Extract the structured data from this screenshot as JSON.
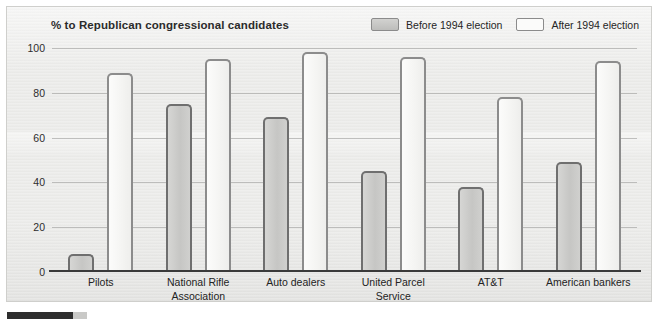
{
  "chart_data": {
    "type": "bar",
    "title": "% to Republican congressional candidates",
    "xlabel": "",
    "ylabel": "",
    "ylim": [
      0,
      100
    ],
    "yticks": [
      100,
      80,
      60,
      40,
      20,
      0
    ],
    "grid": true,
    "legend_position": "top-right",
    "categories": [
      "Pilots",
      "National Rifle Association",
      "Auto dealers",
      "United Parcel Service",
      "AT&T",
      "American bankers"
    ],
    "category_lines": [
      [
        "Pilots"
      ],
      [
        "National Rifle",
        "Association"
      ],
      [
        "Auto dealers"
      ],
      [
        "United Parcel",
        "Service"
      ],
      [
        "AT&T"
      ],
      [
        "American bankers"
      ]
    ],
    "series": [
      {
        "name": "Before 1994 election",
        "color": "#cccccа",
        "values": [
          8,
          75,
          69,
          45,
          38,
          49
        ]
      },
      {
        "name": "After 1994 election",
        "color": "#fbfbfa",
        "values": [
          89,
          95,
          98,
          96,
          78,
          94
        ]
      }
    ]
  },
  "legend": {
    "items": [
      {
        "label": "Before 1994 election",
        "swatch": "filled-gray-swatch"
      },
      {
        "label": "After 1994 election",
        "swatch": "outline-white-swatch"
      }
    ]
  },
  "axis": {
    "yticks": [
      "100",
      "80",
      "60",
      "40",
      "20",
      "0"
    ]
  }
}
